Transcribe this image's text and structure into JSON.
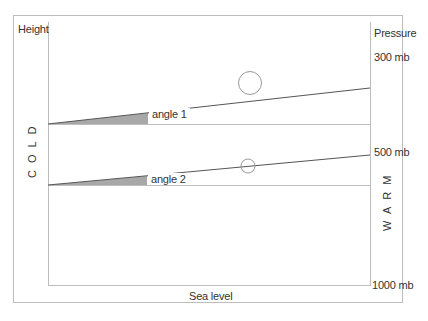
{
  "diagram": {
    "labels": {
      "height": "Height",
      "pressure": "Pressure",
      "sea_level": "Sea level",
      "cold": "COLD",
      "warm": "WARM"
    },
    "pressure_levels": {
      "p300": "300 mb",
      "p500": "500 mb",
      "p1000": "1000 mb"
    },
    "angles": {
      "angle1": "angle 1",
      "angle2": "angle 2"
    },
    "colors": {
      "frame": "#bdbdbd",
      "line": "#555555",
      "shade": "#a8a8a8",
      "circle": "#999999",
      "text": "#333333"
    }
  }
}
